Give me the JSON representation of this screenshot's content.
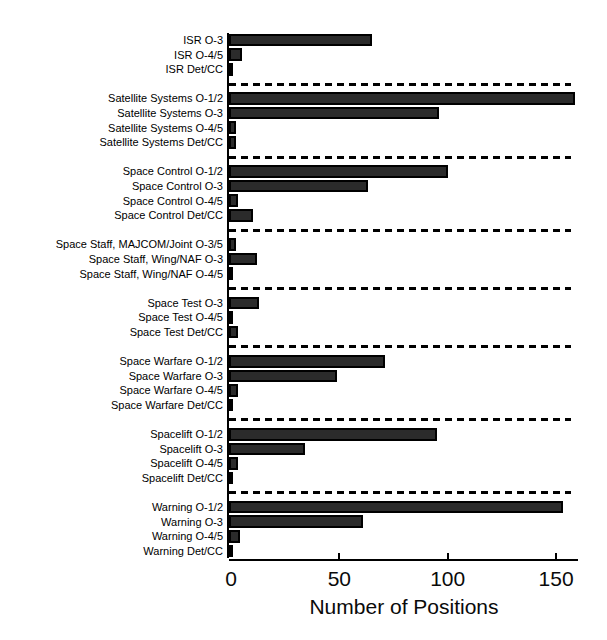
{
  "chart_data": {
    "type": "bar",
    "orientation": "horizontal",
    "title": "",
    "xlabel": "Number of Positions",
    "ylabel": "",
    "xlim": [
      0,
      160
    ],
    "x_ticks": [
      0,
      50,
      100,
      150
    ],
    "grid": false,
    "legend": "none",
    "bar_color": "#2b2b2b",
    "bar_border_color": "#000000",
    "separator_style": "dashed",
    "groups": [
      {
        "name": "ISR",
        "bars": [
          {
            "label": "ISR O-3",
            "value": 66
          },
          {
            "label": "ISR O-4/5",
            "value": 6
          },
          {
            "label": "ISR Det/CC",
            "value": 2
          }
        ]
      },
      {
        "name": "Satellite Systems",
        "bars": [
          {
            "label": "Satellite Systems O-1/2",
            "value": 160
          },
          {
            "label": "Satellite Systems O-3",
            "value": 97
          },
          {
            "label": "Satellite Systems O-4/5",
            "value": 3
          },
          {
            "label": "Satellite Systems Det/CC",
            "value": 3
          }
        ]
      },
      {
        "name": "Space Control",
        "bars": [
          {
            "label": "Space Control O-1/2",
            "value": 101
          },
          {
            "label": "Space Control O-3",
            "value": 64
          },
          {
            "label": "Space Control O-4/5",
            "value": 4
          },
          {
            "label": "Space Control Det/CC",
            "value": 11
          }
        ]
      },
      {
        "name": "Space Staff",
        "bars": [
          {
            "label": "Space Staff, MAJCOM/Joint O-3/5",
            "value": 3
          },
          {
            "label": "Space Staff, Wing/NAF O-3",
            "value": 13
          },
          {
            "label": "Space Staff, Wing/NAF O-4/5",
            "value": 2
          }
        ]
      },
      {
        "name": "Space Test",
        "bars": [
          {
            "label": "Space Test O-3",
            "value": 14
          },
          {
            "label": "Space Test O-4/5",
            "value": 2
          },
          {
            "label": "Space Test Det/CC",
            "value": 4
          }
        ]
      },
      {
        "name": "Space Warfare",
        "bars": [
          {
            "label": "Space Warfare O-1/2",
            "value": 72
          },
          {
            "label": "Space Warfare O-3",
            "value": 50
          },
          {
            "label": "Space Warfare O-4/5",
            "value": 4
          },
          {
            "label": "Space Warfare Det/CC",
            "value": 2
          }
        ]
      },
      {
        "name": "Spacelift",
        "bars": [
          {
            "label": "Spacelift O-1/2",
            "value": 96
          },
          {
            "label": "Spacelift O-3",
            "value": 35
          },
          {
            "label": "Spacelift O-4/5",
            "value": 4
          },
          {
            "label": "Spacelift Det/CC",
            "value": 1
          }
        ]
      },
      {
        "name": "Warning",
        "bars": [
          {
            "label": "Warning O-1/2",
            "value": 154
          },
          {
            "label": "Warning O-3",
            "value": 62
          },
          {
            "label": "Warning O-4/5",
            "value": 5
          },
          {
            "label": "Warning Det/CC",
            "value": 2
          }
        ]
      }
    ]
  }
}
